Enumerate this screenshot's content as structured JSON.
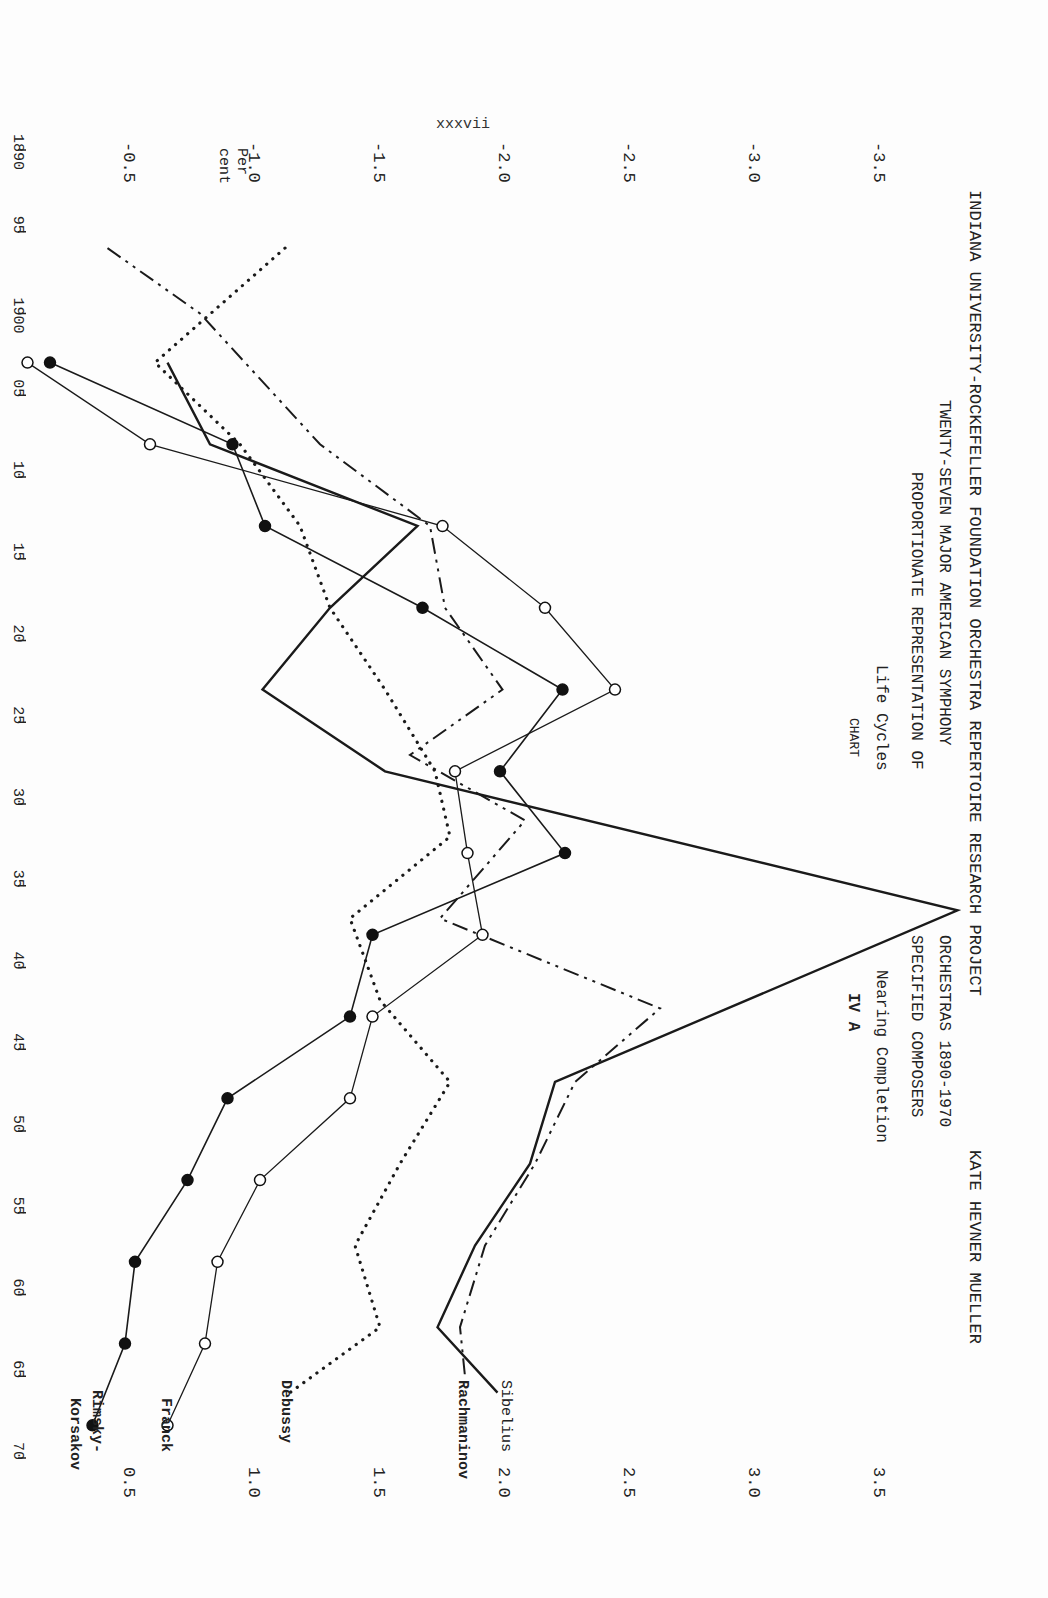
{
  "page_number": "xxxvii",
  "header": {
    "line1": "INDIANA UNIVERSITY-ROCKEFELLER FOUNDATION ORCHESTRA REPERTOIRE RESEARCH PROJECT",
    "author": "KATE HEVNER MUELLER",
    "line2_left": "TWENTY-SEVEN MAJOR AMERICAN SYMPHONY",
    "line2_right": "ORCHESTRAS  1890-1970",
    "line3_left": "PROPORTIONATE REPRESENTATION OF",
    "line3_right": "SPECIFIED COMPOSERS",
    "line4_left": "Life Cycles",
    "line4_right": "Nearing Completion",
    "line5_left": "CHART",
    "line5_right": "IV  A"
  },
  "axis": {
    "y_title_line1": "Per",
    "y_title_line2": "cent",
    "left_ticks": [
      "-0.5",
      "-1.0",
      "-1.5",
      "-2.0",
      "-2.5",
      "-3.0",
      "-3.5"
    ],
    "right_ticks": [
      "0.5",
      "1.0",
      "1.5",
      "2.0",
      "2.5",
      "3.0",
      "3.5"
    ],
    "x_ticks": [
      "1890",
      "95",
      "1900",
      "05",
      "10",
      "15",
      "20",
      "25",
      "30",
      "35",
      "40",
      "45",
      "50",
      "55",
      "60",
      "65",
      "70"
    ]
  },
  "chart_data": {
    "type": "line",
    "subtitle": "Twenty-Seven Major American Symphony Orchestras 1890-1970",
    "xlabel": "Year",
    "ylabel": "Per cent",
    "xlim": [
      1890,
      1970
    ],
    "ylim": [
      0,
      3.5
    ],
    "grid": false,
    "legend_position": "inline labels at line ends",
    "x_ticks": [
      1890,
      1895,
      1900,
      1905,
      1910,
      1915,
      1920,
      1925,
      1930,
      1935,
      1940,
      1945,
      1950,
      1955,
      1960,
      1965,
      1970
    ],
    "y_ticks": [
      0.5,
      1.0,
      1.5,
      2.0,
      2.5,
      3.0,
      3.5
    ],
    "series": [
      {
        "name": "Sibelius",
        "style": "solid-thick",
        "marker": "none",
        "points": [
          [
            1903,
            0.65
          ],
          [
            1908,
            0.82
          ],
          [
            1913,
            1.65
          ],
          [
            1918,
            1.3
          ],
          [
            1923,
            1.03
          ],
          [
            1928,
            1.52
          ],
          [
            1936.5,
            3.81
          ],
          [
            1947,
            2.2
          ],
          [
            1952,
            2.1
          ],
          [
            1957,
            1.88
          ],
          [
            1962,
            1.73
          ],
          [
            1966,
            1.97
          ]
        ]
      },
      {
        "name": "Rachmaninov",
        "style": "dash-dot-dot",
        "marker": "none",
        "points": [
          [
            1896,
            0.41
          ],
          [
            1900,
            0.78
          ],
          [
            1908,
            1.26
          ],
          [
            1913,
            1.7
          ],
          [
            1918,
            1.76
          ],
          [
            1923,
            1.99
          ],
          [
            1927,
            1.62
          ],
          [
            1931,
            2.08
          ],
          [
            1937,
            1.74
          ],
          [
            1942.5,
            2.62
          ],
          [
            1947,
            2.28
          ],
          [
            1952,
            2.12
          ],
          [
            1957,
            1.92
          ],
          [
            1962,
            1.82
          ],
          [
            1965,
            1.84
          ]
        ]
      },
      {
        "name": "Debussy",
        "style": "dotted",
        "marker": "none",
        "points": [
          [
            1896,
            1.12
          ],
          [
            1903,
            0.6
          ],
          [
            1908,
            0.94
          ],
          [
            1913,
            1.18
          ],
          [
            1918,
            1.3
          ],
          [
            1923,
            1.52
          ],
          [
            1928,
            1.72
          ],
          [
            1932,
            1.78
          ],
          [
            1937,
            1.38
          ],
          [
            1942,
            1.5
          ],
          [
            1947,
            1.78
          ],
          [
            1952,
            1.58
          ],
          [
            1957,
            1.4
          ],
          [
            1962,
            1.5
          ],
          [
            1966,
            1.14
          ]
        ]
      },
      {
        "name": "Franck",
        "style": "solid-thin",
        "marker": "open-circle",
        "points": [
          [
            1903,
            0.09
          ],
          [
            1908,
            0.58
          ],
          [
            1913,
            1.75
          ],
          [
            1918,
            2.16
          ],
          [
            1923,
            2.44
          ],
          [
            1928,
            1.8
          ],
          [
            1933,
            1.85
          ],
          [
            1938,
            1.91
          ],
          [
            1943,
            1.47
          ],
          [
            1948,
            1.38
          ],
          [
            1953,
            1.02
          ],
          [
            1958,
            0.85
          ],
          [
            1963,
            0.8
          ],
          [
            1968,
            0.65
          ]
        ]
      },
      {
        "name": "Rimsky-Korsakov",
        "style": "solid",
        "marker": "filled-circle",
        "points": [
          [
            1903,
            0.18
          ],
          [
            1908,
            0.91
          ],
          [
            1913,
            1.04
          ],
          [
            1918,
            1.67
          ],
          [
            1923,
            2.23
          ],
          [
            1928,
            1.98
          ],
          [
            1933,
            2.24
          ],
          [
            1938,
            1.47
          ],
          [
            1943,
            1.38
          ],
          [
            1948,
            0.89
          ],
          [
            1953,
            0.73
          ],
          [
            1958,
            0.52
          ],
          [
            1963,
            0.48
          ],
          [
            1968,
            0.35
          ]
        ]
      }
    ]
  },
  "labels": {
    "sibelius": "Sibelius",
    "rachmaninov": "Rachmaninov",
    "debussy": "Debussy",
    "franck": "Franck",
    "rimsky_line1": "Rimsky-",
    "rimsky_line2": "Korsakov"
  }
}
